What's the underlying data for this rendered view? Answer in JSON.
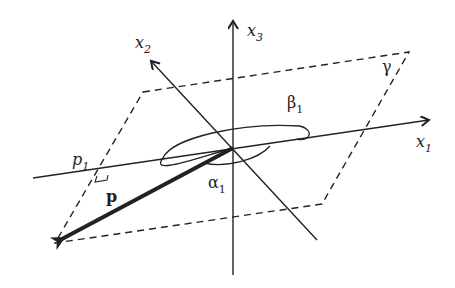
{
  "diagram": {
    "axes": [
      {
        "name": "x1",
        "label": "x",
        "sub": "1"
      },
      {
        "name": "x2",
        "label": "x",
        "sub": "2"
      },
      {
        "name": "x3",
        "label": "x",
        "sub": "3"
      }
    ],
    "plane_label": "γ",
    "vector_label": "p",
    "projection_label": {
      "label": "p",
      "sub": "1"
    },
    "angles": [
      {
        "name": "alpha1",
        "label": "α",
        "sub": "1"
      },
      {
        "name": "beta1",
        "label": "β",
        "sub": "1"
      }
    ],
    "colors": {
      "stroke": "#222222",
      "background": "#ffffff"
    }
  }
}
